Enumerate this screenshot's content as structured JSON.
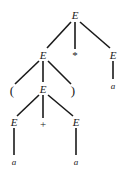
{
  "figure": {
    "kind": "parse-tree",
    "expression": "( a + a ) * a",
    "background_color": "#ffffff",
    "ink_color": "#1a1a1a",
    "width": 132,
    "height": 177
  },
  "nodes": [
    {
      "id": "n0",
      "label": "E",
      "role": "nonterminal",
      "x": 75,
      "y": 15
    },
    {
      "id": "n1",
      "label": "E",
      "role": "nonterminal",
      "x": 43,
      "y": 55
    },
    {
      "id": "n2",
      "label": "*",
      "role": "operator",
      "x": 75,
      "y": 55
    },
    {
      "id": "n3",
      "label": "E",
      "role": "nonterminal",
      "x": 113,
      "y": 55
    },
    {
      "id": "n4",
      "label": "(",
      "role": "paren",
      "x": 12,
      "y": 90
    },
    {
      "id": "n5",
      "label": "E",
      "role": "nonterminal",
      "x": 43,
      "y": 89
    },
    {
      "id": "n6",
      "label": ")",
      "role": "paren",
      "x": 73,
      "y": 90
    },
    {
      "id": "n7",
      "label": "a",
      "role": "terminal",
      "x": 113,
      "y": 86
    },
    {
      "id": "n8",
      "label": "E",
      "role": "nonterminal",
      "x": 14,
      "y": 122
    },
    {
      "id": "n9",
      "label": "+",
      "role": "operator",
      "x": 43,
      "y": 124
    },
    {
      "id": "n10",
      "label": "E",
      "role": "nonterminal",
      "x": 76,
      "y": 122
    },
    {
      "id": "n11",
      "label": "a",
      "role": "terminal",
      "x": 14,
      "y": 162
    },
    {
      "id": "n12",
      "label": "a",
      "role": "terminal",
      "x": 76,
      "y": 162
    }
  ],
  "edges": [
    {
      "from": "n0",
      "to": "n1",
      "x1": 71,
      "y1": 22,
      "x2": 47,
      "y2": 48
    },
    {
      "from": "n0",
      "to": "n2",
      "x1": 75,
      "y1": 22,
      "x2": 75,
      "y2": 49
    },
    {
      "from": "n0",
      "to": "n3",
      "x1": 80,
      "y1": 22,
      "x2": 110,
      "y2": 48
    },
    {
      "from": "n1",
      "to": "n4",
      "x1": 39,
      "y1": 61,
      "x2": 15,
      "y2": 84
    },
    {
      "from": "n1",
      "to": "n5",
      "x1": 43,
      "y1": 61,
      "x2": 43,
      "y2": 82
    },
    {
      "from": "n1",
      "to": "n6",
      "x1": 48,
      "y1": 61,
      "x2": 71,
      "y2": 84
    },
    {
      "from": "n3",
      "to": "n7",
      "x1": 113,
      "y1": 61,
      "x2": 113,
      "y2": 79
    },
    {
      "from": "n5",
      "to": "n8",
      "x1": 39,
      "y1": 95,
      "x2": 17,
      "y2": 116
    },
    {
      "from": "n5",
      "to": "n9",
      "x1": 43,
      "y1": 95,
      "x2": 43,
      "y2": 118
    },
    {
      "from": "n5",
      "to": "n10",
      "x1": 48,
      "y1": 95,
      "x2": 73,
      "y2": 116
    },
    {
      "from": "n8",
      "to": "n11",
      "x1": 14,
      "y1": 128,
      "x2": 14,
      "y2": 155
    },
    {
      "from": "n10",
      "to": "n12",
      "x1": 76,
      "y1": 128,
      "x2": 76,
      "y2": 155
    }
  ]
}
